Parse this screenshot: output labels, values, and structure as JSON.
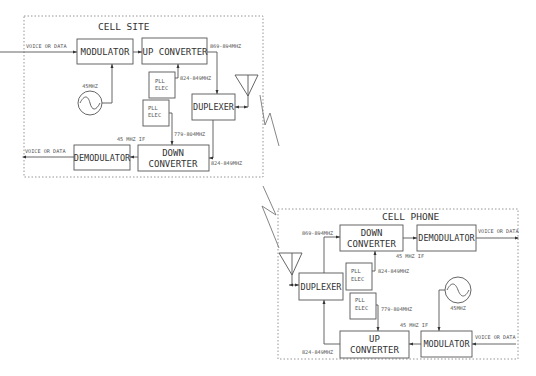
{
  "diagram": {
    "cell_site": {
      "title": "CELL SITE",
      "blocks": {
        "modulator": "MODULATOR",
        "up_converter": "UP CONVERTER",
        "duplexer": "DUPLEXER",
        "demodulator": "DEMODULATOR",
        "down_converter_1": "DOWN",
        "down_converter_2": "CONVERTER",
        "pll1_a": "PLL",
        "pll1_b": "ELEC",
        "pll2_a": "PLL",
        "pll2_b": "ELEC"
      },
      "labels": {
        "voice_in": "VOICE OR DATA",
        "voice_out": "VOICE OR DATA",
        "osc": "45MHZ",
        "tx_band": "869-894MHZ",
        "pll1_freq": "824-849MHZ",
        "pll2_freq": "779-804MHZ",
        "if": "45 MHZ IF",
        "rx_band": "824-849MHZ"
      }
    },
    "cell_phone": {
      "title": "CELL PHONE",
      "blocks": {
        "down_converter_1": "DOWN",
        "down_converter_2": "CONVERTER",
        "demodulator": "DEMODULATOR",
        "duplexer": "DUPLEXER",
        "up_converter_1": "UP",
        "up_converter_2": "CONVERTER",
        "modulator": "MODULATOR",
        "pll1_a": "PLL",
        "pll1_b": "ELEC",
        "pll2_a": "PLL",
        "pll2_b": "ELEC"
      },
      "labels": {
        "rx_band": "869-894MHZ",
        "voice_out": "VOICE OR DATA",
        "if_rx": "45 MHZ IF",
        "pll1_freq": "824-849MHZ",
        "pll2_freq": "779-804MHZ",
        "osc": "45MHZ",
        "if_tx": "45 MHZ IF",
        "voice_in": "VOICE OR DATA",
        "tx_band": "824-849MHZ"
      }
    }
  }
}
